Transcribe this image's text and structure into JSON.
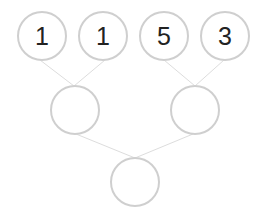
{
  "puzzle": {
    "type": "sum-pyramid",
    "colors": {
      "node_border": "#cfcfcf",
      "connector": "#dddddd",
      "text": "#222222",
      "background": "#ffffff"
    },
    "rows": [
      {
        "nodes": [
          {
            "value": "1"
          },
          {
            "value": "1"
          },
          {
            "value": "5"
          },
          {
            "value": "3"
          }
        ]
      },
      {
        "nodes": [
          {
            "value": ""
          },
          {
            "value": ""
          }
        ]
      },
      {
        "nodes": [
          {
            "value": ""
          }
        ]
      }
    ]
  }
}
